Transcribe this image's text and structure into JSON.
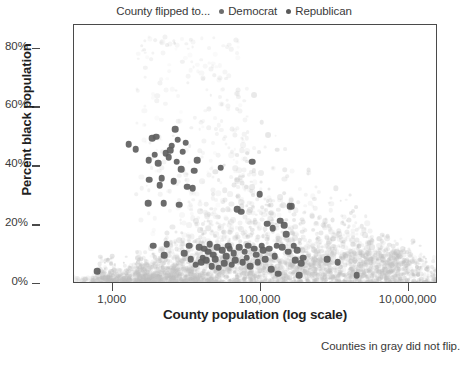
{
  "legend": {
    "title": "County flipped to...",
    "items": [
      {
        "label": "Democrat",
        "color": "#6d6d6d",
        "marker": "legend-dot-democrat"
      },
      {
        "label": "Republican",
        "color": "#5a5a5a",
        "marker": "legend-dot-republican"
      }
    ]
  },
  "footnote": "Counties in gray did not flip.",
  "chart_data": {
    "type": "scatter",
    "title": "",
    "subtitle": "",
    "xlabel": "County population (log scale)",
    "ylabel": "Percent black population",
    "annotation": "Counties in gray did not flip.",
    "legend_title": "County flipped to...",
    "legend_position": "top-center",
    "grid": false,
    "xscale": "log",
    "xlim": [
      300,
      25000000
    ],
    "ylim": [
      0,
      88
    ],
    "xticks": [
      1000,
      100000,
      10000000
    ],
    "xticklabels": [
      "1,000",
      "100,000",
      "10,000,000"
    ],
    "yticks": [
      0,
      20,
      40,
      60,
      80
    ],
    "yticklabels": [
      "0%",
      "20%",
      "40%",
      "60%",
      "80%"
    ],
    "series": [
      {
        "name": "Counties that did not flip",
        "color": "#b9b9b9",
        "style": "light-gray-cloud",
        "note": "dense low-opacity cloud of all US counties",
        "points": [
          [
            480,
            1.1
          ],
          [
            560,
            0.8
          ],
          [
            640,
            1.6
          ],
          [
            700,
            0.6
          ],
          [
            820,
            2.2
          ],
          [
            900,
            1.0
          ],
          [
            980,
            3.0
          ],
          [
            1100,
            1.4
          ],
          [
            1200,
            0.7
          ],
          [
            1300,
            2.6
          ],
          [
            1450,
            1.2
          ],
          [
            1600,
            4.0
          ],
          [
            1750,
            0.9
          ],
          [
            1900,
            2.0
          ],
          [
            2100,
            5.5
          ],
          [
            2300,
            1.3
          ],
          [
            2500,
            3.2
          ],
          [
            2700,
            8.0
          ],
          [
            2900,
            1.8
          ],
          [
            3200,
            6.0
          ],
          [
            3500,
            2.4
          ],
          [
            3800,
            11.0
          ],
          [
            4100,
            1.5
          ],
          [
            4500,
            4.4
          ],
          [
            4900,
            9.0
          ],
          [
            5300,
            2.8
          ],
          [
            5800,
            14.0
          ],
          [
            6200,
            3.6
          ],
          [
            6800,
            7.5
          ],
          [
            7400,
            2.0
          ],
          [
            8000,
            18.0
          ],
          [
            8700,
            5.0
          ],
          [
            9400,
            10.5
          ],
          [
            10200,
            3.1
          ],
          [
            11000,
            22.0
          ],
          [
            12000,
            6.4
          ],
          [
            13000,
            15.0
          ],
          [
            14000,
            2.6
          ],
          [
            15500,
            28.0
          ],
          [
            17000,
            8.8
          ],
          [
            18500,
            12.0
          ],
          [
            20000,
            4.2
          ],
          [
            22000,
            33.0
          ],
          [
            24000,
            17.5
          ],
          [
            26000,
            7.0
          ],
          [
            28000,
            25.0
          ],
          [
            31000,
            3.4
          ],
          [
            34000,
            40.0
          ],
          [
            37000,
            13.5
          ],
          [
            40000,
            9.5
          ],
          [
            44000,
            30.0
          ],
          [
            48000,
            5.6
          ],
          [
            52000,
            46.0
          ],
          [
            57000,
            19.0
          ],
          [
            62000,
            11.5
          ],
          [
            68000,
            36.0
          ],
          [
            74000,
            7.8
          ],
          [
            81000,
            52.0
          ],
          [
            88000,
            24.0
          ],
          [
            96000,
            14.5
          ],
          [
            105000,
            42.0
          ],
          [
            115000,
            6.2
          ],
          [
            125000,
            32.0
          ],
          [
            137000,
            18.0
          ],
          [
            150000,
            9.0
          ],
          [
            164000,
            27.0
          ],
          [
            179000,
            4.8
          ],
          [
            196000,
            38.0
          ],
          [
            214000,
            21.0
          ],
          [
            234000,
            12.5
          ],
          [
            256000,
            16.0
          ],
          [
            280000,
            7.2
          ],
          [
            306000,
            29.0
          ],
          [
            335000,
            10.0
          ],
          [
            366000,
            23.0
          ],
          [
            400000,
            5.4
          ],
          [
            440000,
            31.0
          ],
          [
            480000,
            13.0
          ],
          [
            525000,
            19.5
          ],
          [
            575000,
            8.2
          ],
          [
            630000,
            26.0
          ],
          [
            690000,
            11.0
          ],
          [
            755000,
            20.0
          ],
          [
            825000,
            6.8
          ],
          [
            900000,
            15.5
          ],
          [
            985000,
            24.5
          ],
          [
            1080000,
            9.8
          ],
          [
            1180000,
            17.0
          ],
          [
            1290000,
            12.2
          ],
          [
            1410000,
            22.5
          ],
          [
            1550000,
            7.6
          ],
          [
            1700000,
            14.0
          ],
          [
            1860000,
            19.0
          ],
          [
            2030000,
            10.4
          ],
          [
            2220000,
            16.5
          ],
          [
            2430000,
            8.6
          ],
          [
            2660000,
            13.2
          ],
          [
            2900000,
            11.8
          ],
          [
            3180000,
            9.2
          ],
          [
            3480000,
            15.0
          ],
          [
            3800000,
            7.4
          ],
          [
            4200000,
            12.0
          ],
          [
            4600000,
            10.8
          ],
          [
            5100000,
            8.0
          ],
          [
            5600000,
            11.2
          ],
          [
            6200000,
            9.6
          ],
          [
            6800000,
            10.2
          ],
          [
            7500000,
            8.4
          ],
          [
            8300000,
            11.6
          ],
          [
            9100000,
            9.0
          ],
          [
            10000000,
            10.5
          ]
        ]
      },
      {
        "name": "Counties that flipped",
        "color": "#5e5e5e",
        "style": "dark-dot",
        "points": [
          [
            620,
            4.3
          ],
          [
            1650,
            47.5
          ],
          [
            2050,
            45.8
          ],
          [
            3000,
            27.5
          ],
          [
            3050,
            42.0
          ],
          [
            3100,
            35.5
          ],
          [
            3400,
            49.5
          ],
          [
            3500,
            13.0
          ],
          [
            3700,
            44.0
          ],
          [
            3900,
            50.0
          ],
          [
            4100,
            41.0
          ],
          [
            4300,
            33.5
          ],
          [
            4600,
            36.0
          ],
          [
            4900,
            27.5
          ],
          [
            5000,
            9.8
          ],
          [
            5200,
            44.5
          ],
          [
            5400,
            13.5
          ],
          [
            5700,
            43.0
          ],
          [
            6000,
            45.5
          ],
          [
            6300,
            47.0
          ],
          [
            6700,
            35.0
          ],
          [
            7000,
            52.5
          ],
          [
            7300,
            41.5
          ],
          [
            7600,
            49.0
          ],
          [
            8000,
            27.0
          ],
          [
            8400,
            39.0
          ],
          [
            8800,
            45.0
          ],
          [
            9200,
            10.5
          ],
          [
            9700,
            48.0
          ],
          [
            10200,
            33.0
          ],
          [
            10800,
            13.0
          ],
          [
            11400,
            8.5
          ],
          [
            12000,
            32.5
          ],
          [
            12600,
            38.5
          ],
          [
            13300,
            6.5
          ],
          [
            14000,
            42.0
          ],
          [
            14800,
            12.5
          ],
          [
            15600,
            7.5
          ],
          [
            16500,
            9.0
          ],
          [
            17400,
            12.0
          ],
          [
            18400,
            8.0
          ],
          [
            19400,
            11.0
          ],
          [
            20500,
            13.5
          ],
          [
            21700,
            6.0
          ],
          [
            23000,
            10.0
          ],
          [
            24300,
            8.5
          ],
          [
            25700,
            12.5
          ],
          [
            27200,
            5.5
          ],
          [
            28800,
            39.5
          ],
          [
            30500,
            11.5
          ],
          [
            32300,
            7.0
          ],
          [
            34200,
            9.5
          ],
          [
            36200,
            13.0
          ],
          [
            38400,
            12.0
          ],
          [
            40700,
            6.5
          ],
          [
            43100,
            10.5
          ],
          [
            45600,
            8.0
          ],
          [
            48400,
            25.5
          ],
          [
            51200,
            12.5
          ],
          [
            54300,
            24.5
          ],
          [
            57500,
            7.5
          ],
          [
            61000,
            11.0
          ],
          [
            64600,
            9.0
          ],
          [
            68500,
            13.0
          ],
          [
            72600,
            6.0
          ],
          [
            77000,
            41.5
          ],
          [
            81600,
            12.0
          ],
          [
            86500,
            10.0
          ],
          [
            91700,
            7.5
          ],
          [
            97200,
            30.5
          ],
          [
            103000,
            13.0
          ],
          [
            109000,
            11.5
          ],
          [
            116000,
            8.5
          ],
          [
            123000,
            20.5
          ],
          [
            130000,
            12.0
          ],
          [
            138000,
            5.0
          ],
          [
            146000,
            19.0
          ],
          [
            155000,
            9.5
          ],
          [
            164000,
            13.0
          ],
          [
            174000,
            3.5
          ],
          [
            185000,
            21.5
          ],
          [
            196000,
            12.5
          ],
          [
            208000,
            20.0
          ],
          [
            220000,
            17.0
          ],
          [
            234000,
            11.0
          ],
          [
            248000,
            26.5
          ],
          [
            263000,
            26.5
          ],
          [
            279000,
            13.0
          ],
          [
            296000,
            8.0
          ],
          [
            314000,
            11.5
          ],
          [
            333000,
            3.0
          ],
          [
            353000,
            7.0
          ],
          [
            374000,
            9.0
          ],
          [
            800000,
            8.5
          ],
          [
            1100000,
            7.5
          ],
          [
            2000000,
            3.0
          ]
        ]
      }
    ]
  }
}
